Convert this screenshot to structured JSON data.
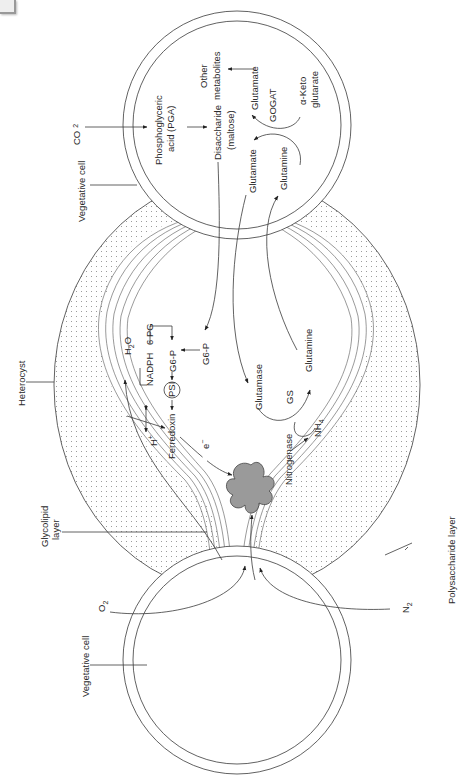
{
  "diagram": {
    "orientation": "rotated-90deg",
    "structures": {
      "vegetative_cell_top": "Vegetative cell",
      "vegetative_cell_bottom": "Vegetative cell",
      "heterocyst": "Heterocyst",
      "glycolipid_layer": "Glycolipid layer",
      "polysaccharide_layer": "Polysaccharide layer",
      "nitrogenase_enzyme": "Nitrogenase"
    },
    "labels": {
      "co2": "CO",
      "co2_sub": "2",
      "o2": "O",
      "o2_sub": "2",
      "n2": "N",
      "n2_sub": "2",
      "pga_line1": "Phosphoglyceric",
      "pga_line2": "acid (PGA)",
      "disaccharide_line1": "Disaccharide",
      "disaccharide_line2": "(maltose)",
      "other_line1": "Other",
      "other_line2": "metabolites",
      "glutamate_top": "Glutamate",
      "gogat": "GOGAT",
      "keto_line1": "α-Keto",
      "keto_line2": "glutarate",
      "glutamate_mid": "Glutamate",
      "glutamine_top": "Glutamine",
      "g6p_outer": "G6-P",
      "g6p_inner": "G6-P",
      "six_pg": "6 PG",
      "nadph": "NADPH",
      "h2o": "H",
      "h2o_sub": "2",
      "h2o_o": "O",
      "psi": "PSI",
      "ferredoxin": "Ferredoxin",
      "h_plus": "H",
      "h_plus_sup": "+",
      "electron": "e",
      "electron_sup": "−",
      "glutamase": "Glutamase",
      "gs": "GS",
      "glutamine_bottom": "Glutamine",
      "nitrogenase_label": "Nitrogenase",
      "nh4": "NH",
      "nh4_sub": "4",
      "vegetative_cell_label_top": "Vegetative cell",
      "heterocyst_label": "Heterocyst",
      "glycolipid_line1": "Glycolipid",
      "glycolipid_line2": "layer",
      "vegetative_cell_label_bottom": "Vegetative cell",
      "polysaccharide_label": "Polysaccharide layer"
    },
    "colors": {
      "line": "#3a3a3a",
      "nitrogenase_fill": "#9a9a9a",
      "dots": "#8a8a8a",
      "background": "#ffffff"
    }
  }
}
